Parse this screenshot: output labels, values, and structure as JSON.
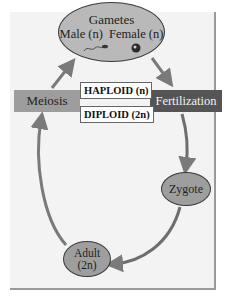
{
  "diagram": {
    "nodes": {
      "gametes": {
        "title": "Gametes",
        "male": "Male (n)",
        "female": "Female (n)",
        "icons": [
          "sperm-icon",
          "egg-icon"
        ]
      },
      "fertilization": {
        "label": "Fertilization"
      },
      "zygote": {
        "label": "Zygote"
      },
      "adult": {
        "label": "Adult",
        "ploidy": "(2n)"
      },
      "meiosis": {
        "label": "Meiosis"
      }
    },
    "phase_labels": {
      "haploid": "HAPLOID (n)",
      "diploid": "DIPLOID (2n)"
    },
    "edges": [
      [
        "gametes",
        "fertilization"
      ],
      [
        "fertilization",
        "zygote"
      ],
      [
        "zygote",
        "adult"
      ],
      [
        "adult",
        "meiosis"
      ],
      [
        "meiosis",
        "gametes"
      ]
    ],
    "colors": {
      "panel": "#f3f3f3",
      "arrow": "#7a7a7a",
      "gametes_fill": "#b9b9b9",
      "ellipse_fill": "#9e9e9e",
      "meiosis_fill": "#9d9d9d",
      "fertilization_fill": "#555555"
    }
  }
}
